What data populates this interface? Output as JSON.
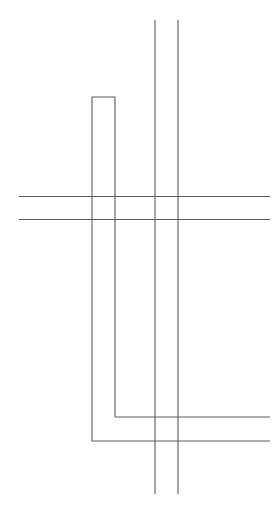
{
  "canvas": {
    "width": 280,
    "height": 514,
    "background_color": "#ffffff",
    "title": "Line Drawing"
  },
  "figure": {
    "stroke_color": "#5a5a5a",
    "stroke_width": 1.1
  },
  "elements": [
    {
      "name": "vertical-line-left",
      "type": "line",
      "x1": 155.0,
      "y1": 20.0,
      "x2": 155.0,
      "y2": 494.0,
      "color": "#5a5a5a",
      "width": 1.1
    },
    {
      "name": "vertical-line-right",
      "type": "line",
      "x1": 178.0,
      "y1": 20.0,
      "x2": 178.0,
      "y2": 494.0,
      "color": "#5a5a5a",
      "width": 1.1
    },
    {
      "name": "horizontal-line-upper",
      "type": "line",
      "x1": 19.0,
      "y1": 196.5,
      "x2": 270.0,
      "y2": 196.5,
      "color": "#5a5a5a",
      "width": 1.1
    },
    {
      "name": "horizontal-line-lower",
      "type": "line",
      "x1": 19.0,
      "y1": 219.5,
      "x2": 270.0,
      "y2": 219.5,
      "color": "#5a5a5a",
      "width": 1.1
    },
    {
      "name": "hook-outline-path",
      "type": "polyline",
      "points": "115,417 115,97 92,97 92,441 270,441",
      "color": "#5a5a5a",
      "width": 1.1
    },
    {
      "name": "hook-inner-foot",
      "type": "line",
      "x1": 115.0,
      "y1": 417.0,
      "x2": 270.0,
      "y2": 417.0,
      "color": "#5a5a5a",
      "width": 1.1
    }
  ]
}
